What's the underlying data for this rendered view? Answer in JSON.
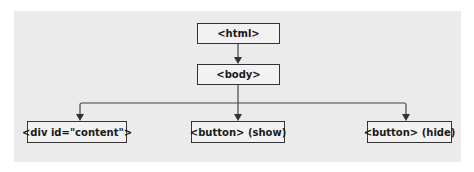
{
  "diagram": {
    "type": "tree",
    "nodes": [
      {
        "id": "html",
        "label": "<html>"
      },
      {
        "id": "body",
        "label": "<body>"
      },
      {
        "id": "div",
        "label": "<div id=\"content\">"
      },
      {
        "id": "show",
        "label": "<button> (show)"
      },
      {
        "id": "hide",
        "label": "<button> (hide)"
      }
    ],
    "edges": [
      {
        "from": "html",
        "to": "body"
      },
      {
        "from": "body",
        "to": "div"
      },
      {
        "from": "body",
        "to": "show"
      },
      {
        "from": "body",
        "to": "hide"
      }
    ]
  },
  "colors": {
    "panel": "#ebebeb",
    "border": "#333333",
    "text": "#1a1a1a"
  }
}
